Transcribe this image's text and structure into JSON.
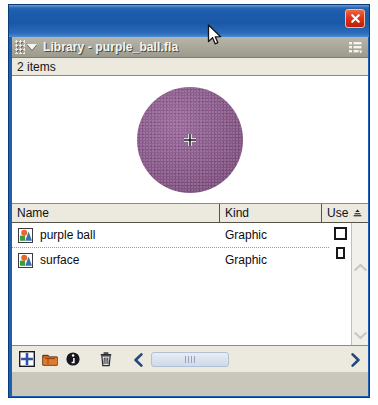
{
  "window": {
    "close_label": "Close",
    "close_icon": "close-x-icon",
    "titlebar_color": "#1d5fb0",
    "close_button_color": "#d4321a"
  },
  "panel": {
    "title": "Library - purple_ball.fla",
    "grip_icon": "drag-grip-icon",
    "collapse_icon": "collapse-triangle-icon",
    "options_menu_icon": "panel-options-menu-icon",
    "header_color": "#a9a79a"
  },
  "status": {
    "item_count_text": "2 items"
  },
  "preview": {
    "symbol_name": "purple ball",
    "shape_icon": "filled-circle-shape",
    "fill_color": "#8b5b8c",
    "registration_icon": "registration-crosshair-icon"
  },
  "list": {
    "columns": [
      {
        "label": "Name",
        "sort_icon": ""
      },
      {
        "label": "Kind",
        "sort_icon": ""
      },
      {
        "label": "Use",
        "sort_icon": "sort-ascending-icon"
      }
    ],
    "rows": [
      {
        "icon": "graphic-symbol-icon",
        "name": "purple ball",
        "kind": "Graphic",
        "use": ""
      },
      {
        "icon": "graphic-symbol-icon",
        "name": "surface",
        "kind": "Graphic",
        "use": ""
      }
    ]
  },
  "scrollbars": {
    "vertical": {
      "up_icon": "chevron-up-icon",
      "down_icon": "chevron-down-icon"
    },
    "horizontal": {
      "left_icon": "chevron-left-icon",
      "right_icon": "chevron-right-icon",
      "thumb_icon": "scrollbar-thumb-grip"
    }
  },
  "toolbar": {
    "buttons": [
      {
        "name": "new-symbol-button",
        "icon": "new-symbol-plus-icon",
        "label": "New Symbol"
      },
      {
        "name": "new-folder-button",
        "icon": "new-folder-icon",
        "label": "New Folder"
      },
      {
        "name": "properties-button",
        "icon": "properties-info-icon",
        "label": "Properties"
      },
      {
        "name": "delete-button",
        "icon": "trash-can-icon",
        "label": "Delete"
      }
    ]
  },
  "pointer": {
    "cursor_icon": "mouse-arrow-cursor"
  }
}
